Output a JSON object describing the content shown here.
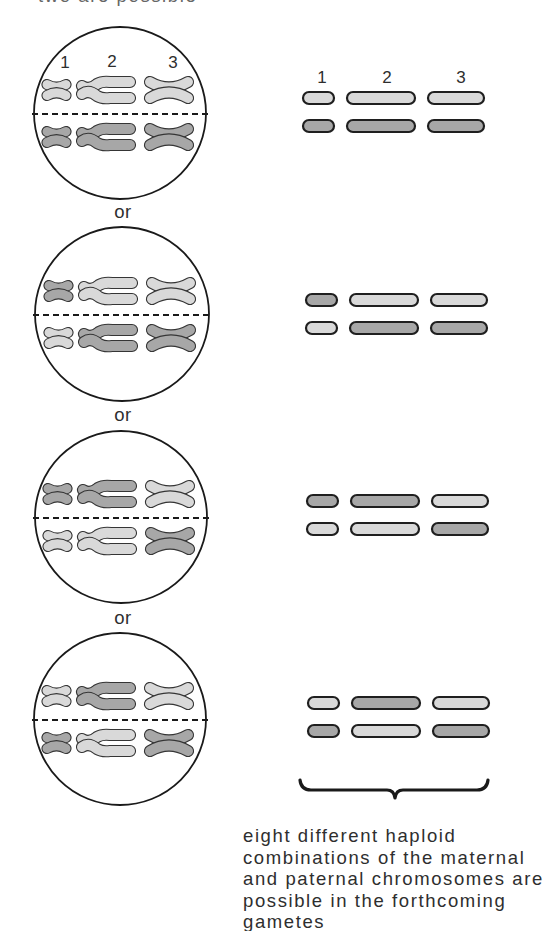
{
  "header_partial": "two are possible",
  "labels": {
    "chromosome_numbers": [
      "1",
      "2",
      "3"
    ],
    "or": "or"
  },
  "colors": {
    "light": "#d9d9d9",
    "dark": "#a7a7a7",
    "chromosome_outline": "#353535",
    "bar_outline": "#1f1f1f",
    "line": "#1a1a1a",
    "text": "#2e2e2e"
  },
  "metaphase_cells": [
    {
      "top_row": [
        "light",
        "light",
        "light"
      ],
      "bottom_row": [
        "dark",
        "dark",
        "dark"
      ]
    },
    {
      "top_row": [
        "dark",
        "light",
        "light"
      ],
      "bottom_row": [
        "light",
        "dark",
        "dark"
      ]
    },
    {
      "top_row": [
        "dark",
        "dark",
        "light"
      ],
      "bottom_row": [
        "light",
        "light",
        "dark"
      ]
    },
    {
      "top_row": [
        "light",
        "dark",
        "light"
      ],
      "bottom_row": [
        "dark",
        "light",
        "dark"
      ]
    }
  ],
  "gametes": [
    {
      "row1": [
        "light",
        "light",
        "light"
      ],
      "row2": [
        "dark",
        "dark",
        "dark"
      ]
    },
    {
      "row1": [
        "dark",
        "light",
        "light"
      ],
      "row2": [
        "light",
        "dark",
        "dark"
      ]
    },
    {
      "row1": [
        "dark",
        "dark",
        "light"
      ],
      "row2": [
        "light",
        "light",
        "dark"
      ]
    },
    {
      "row1": [
        "light",
        "dark",
        "light"
      ],
      "row2": [
        "dark",
        "light",
        "dark"
      ]
    }
  ],
  "caption": {
    "lines": [
      "eight different haploid",
      "combinations of the maternal",
      "and paternal chromosomes are",
      "possible in the forthcoming",
      "gametes"
    ]
  }
}
